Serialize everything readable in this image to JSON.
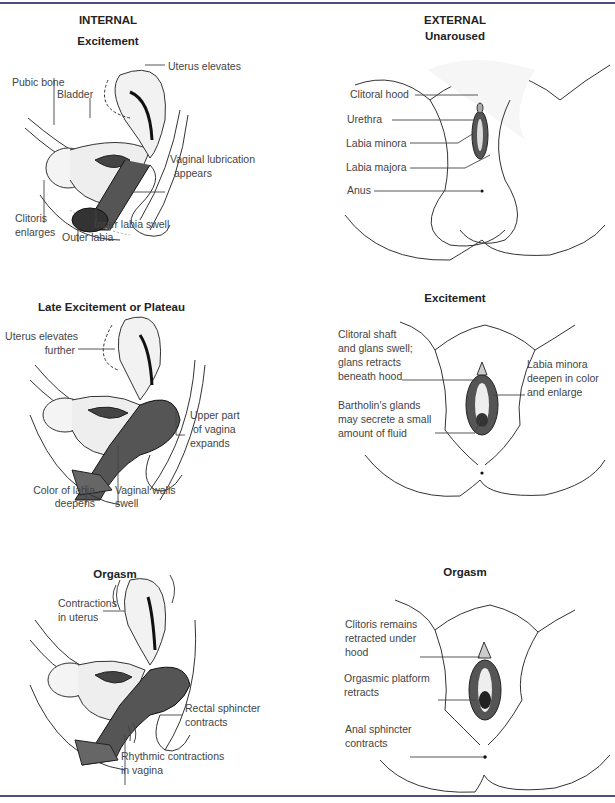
{
  "columns": {
    "internal": "INTERNAL",
    "external": "EXTERNAL"
  },
  "panels": {
    "internal_excitement": {
      "title": "Excitement",
      "labels": [
        "Uterus elevates",
        "Pubic bone",
        "Bladder",
        "Vaginal lubrication",
        "appears",
        "Clitoris",
        "enlarges",
        "Inner labia swell",
        "Outer labia"
      ]
    },
    "external_unaroused": {
      "title": "Unaroused",
      "labels": [
        "Clitoral hood",
        "Urethra",
        "Labia minora",
        "Labia majora",
        "Anus"
      ]
    },
    "internal_plateau": {
      "title": "Late Excitement or Plateau",
      "labels": [
        "Uterus elevates",
        "further",
        "Upper part",
        "of vagina",
        "expands",
        "Color of labia",
        "deepens",
        "Vaginal walls",
        "swell"
      ]
    },
    "external_excitement": {
      "title": "Excitement",
      "labels": [
        "Clitoral shaft",
        "and glans swell;",
        "glans retracts",
        "beneath hood",
        "Labia minora",
        "deepen in color",
        "and enlarge",
        "Bartholin's glands",
        "may secrete a small",
        "amount of fluid"
      ]
    },
    "internal_orgasm": {
      "title": "Orgasm",
      "labels": [
        "Contractions",
        "in uterus",
        "Rectal sphincter",
        "contracts",
        "Rhythmic contractions",
        "in vagina"
      ]
    },
    "external_orgasm": {
      "title": "Orgasm",
      "labels": [
        "Clitoris remains",
        "retracted under",
        "hood",
        "Orgasmic platform",
        "retracts",
        "Anal sphincter",
        "contracts"
      ]
    }
  },
  "colors": {
    "rule": "#4a4f82",
    "text": "#444444",
    "heading": "#222222"
  }
}
